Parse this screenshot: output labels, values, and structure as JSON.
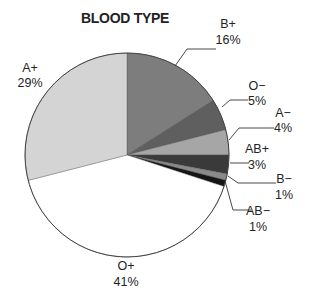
{
  "chart_data": {
    "type": "pie",
    "title": "BLOOD TYPE",
    "start_angle_deg": 0,
    "direction": "clockwise",
    "center": [
      127,
      155
    ],
    "radius": 102,
    "slices": [
      {
        "label": "B+",
        "value": 16,
        "pct_text": "16%",
        "color": "#7d7d7d",
        "label_pos": [
          228,
          28
        ],
        "pct_pos": [
          228,
          44
        ],
        "leader": [
          [
            175,
            66
          ],
          [
            187,
            49
          ],
          [
            216,
            49
          ]
        ]
      },
      {
        "label": "O−",
        "value": 5,
        "pct_text": "5%",
        "color": "#5f5f5f",
        "label_pos": [
          257,
          90
        ],
        "pct_pos": [
          257,
          105
        ],
        "leader": [
          [
            222,
            107
          ],
          [
            230,
            100
          ],
          [
            248,
            100
          ]
        ]
      },
      {
        "label": "A−",
        "value": 4,
        "pct_text": "4%",
        "color": "#a6a6a6",
        "label_pos": [
          283,
          117
        ],
        "pct_pos": [
          283,
          132
        ],
        "leader": [
          [
            229,
            140
          ],
          [
            239,
            128
          ],
          [
            274,
            128
          ]
        ]
      },
      {
        "label": "AB+",
        "value": 3,
        "pct_text": "3%",
        "color": "#3a3a3a",
        "label_pos": [
          257,
          153
        ],
        "pct_pos": [
          257,
          169
        ],
        "leader": [
          [
            230,
            163
          ],
          [
            249,
            163
          ]
        ]
      },
      {
        "label": "B−",
        "value": 1,
        "pct_text": "1%",
        "color": "#8a8a8a",
        "label_pos": [
          284,
          183
        ],
        "pct_pos": [
          284,
          199
        ],
        "leader": [
          [
            228,
            176
          ],
          [
            238,
            183
          ],
          [
            276,
            183
          ]
        ]
      },
      {
        "label": "AB−",
        "value": 1,
        "pct_text": "1%",
        "color": "#151515",
        "label_pos": [
          258,
          215
        ],
        "pct_pos": [
          258,
          231
        ],
        "leader": [
          [
            225,
            181
          ],
          [
            233,
            210
          ],
          [
            251,
            210
          ]
        ]
      },
      {
        "label": "O+",
        "value": 41,
        "pct_text": "41%",
        "color": "#ffffff",
        "label_pos": [
          126,
          270
        ],
        "pct_pos": [
          126,
          286
        ],
        "leader": []
      },
      {
        "label": "A+",
        "value": 29,
        "pct_text": "29%",
        "color": "#d4d4d4",
        "label_pos": [
          30,
          72
        ],
        "pct_pos": [
          30,
          87
        ],
        "leader": []
      }
    ],
    "legend": "none (direct labels)",
    "grid": false
  }
}
